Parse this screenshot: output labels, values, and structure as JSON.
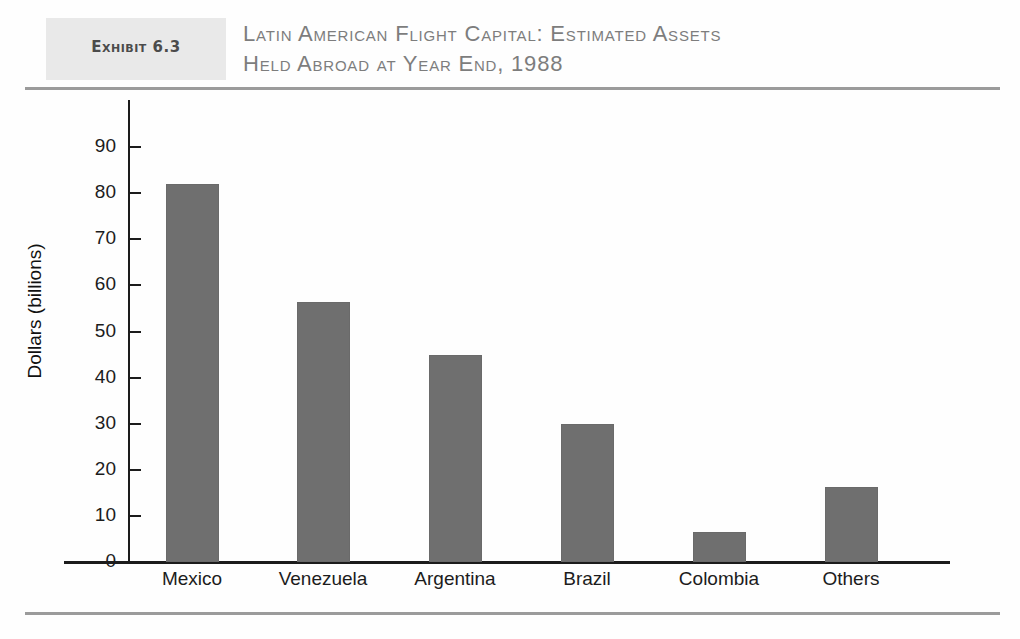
{
  "exhibit": {
    "label": "Exhibit 6.3",
    "title": "Latin American Flight Capital: Estimated Assets\nHeld Abroad at Year End, 1988"
  },
  "colors": {
    "bar_fill": "#6f6f6f",
    "axis": "#1c1c1c",
    "rule": "#9b9b9b",
    "exhibit_box": "#e9e9e9",
    "title_text": "#7d7d7d"
  },
  "chart_data": {
    "type": "bar",
    "title": "Latin American Flight Capital: Estimated Assets Held Abroad at Year End, 1988",
    "xlabel": "",
    "ylabel": "Dollars (billions)",
    "categories": [
      "Mexico",
      "Venezuela",
      "Argentina",
      "Brazil",
      "Colombia",
      "Others"
    ],
    "values": [
      82,
      56.5,
      45,
      30,
      6.5,
      16.3
    ],
    "ylim": [
      0,
      95
    ],
    "yticks": [
      0,
      10,
      20,
      30,
      40,
      50,
      60,
      70,
      80,
      90
    ],
    "ytick_labels": [
      "0",
      "10",
      "20",
      "30",
      "40",
      "50",
      "60",
      "70",
      "80",
      "90"
    ],
    "grid": false,
    "legend": false
  }
}
